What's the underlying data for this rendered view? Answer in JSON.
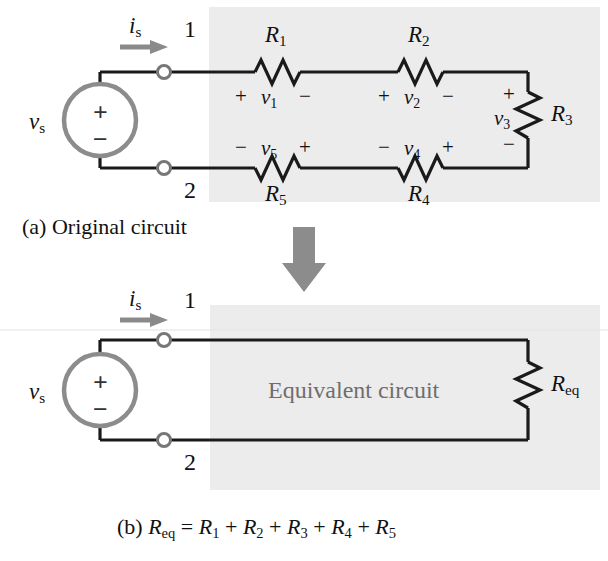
{
  "figure": {
    "type": "circuit-diagram",
    "background": "#ffffff",
    "shade_color": "#ececec",
    "wire_color": "#1a1a1a",
    "source_color": "#8c8c8c",
    "arrow_color": "#8a8a8a",
    "equiv_text_color": "#6e6e6e"
  },
  "panel_a": {
    "caption": "(a) Original circuit",
    "source_label": "v",
    "source_label_sub": "s",
    "source_plus": "+",
    "source_minus": "−",
    "current_label": "i",
    "current_label_sub": "s",
    "node_top": "1",
    "node_bottom": "2",
    "resistors": [
      {
        "name": "R",
        "sub": "1",
        "orientation": "horizontal"
      },
      {
        "name": "R",
        "sub": "2",
        "orientation": "horizontal"
      },
      {
        "name": "R",
        "sub": "3",
        "orientation": "vertical"
      },
      {
        "name": "R",
        "sub": "4",
        "orientation": "horizontal"
      },
      {
        "name": "R",
        "sub": "5",
        "orientation": "horizontal"
      }
    ],
    "voltages": [
      {
        "name": "v",
        "sub": "1",
        "left_sign": "+",
        "right_sign": "−"
      },
      {
        "name": "v",
        "sub": "2",
        "left_sign": "+",
        "right_sign": "−"
      },
      {
        "name": "v",
        "sub": "3",
        "top_sign": "+",
        "bottom_sign": "−"
      },
      {
        "name": "v",
        "sub": "4",
        "left_sign": "−",
        "right_sign": "+"
      },
      {
        "name": "v",
        "sub": "5",
        "left_sign": "−",
        "right_sign": "+"
      }
    ]
  },
  "transition": {
    "arrow": "down-block-arrow"
  },
  "panel_b": {
    "caption_prefix": "(b) ",
    "caption_eq_lhs": "R",
    "caption_eq_lhs_sub": "eq",
    "caption_equals": " = ",
    "caption_terms": [
      "R",
      "R",
      "R",
      "R",
      "R"
    ],
    "caption_term_subs": [
      "1",
      "2",
      "3",
      "4",
      "5"
    ],
    "caption_plus": " + ",
    "box_text": "Equivalent circuit",
    "source_label": "v",
    "source_label_sub": "s",
    "source_plus": "+",
    "source_minus": "−",
    "current_label": "i",
    "current_label_sub": "s",
    "node_top": "1",
    "node_bottom": "2",
    "resistor": {
      "name": "R",
      "sub": "eq",
      "orientation": "vertical"
    }
  }
}
